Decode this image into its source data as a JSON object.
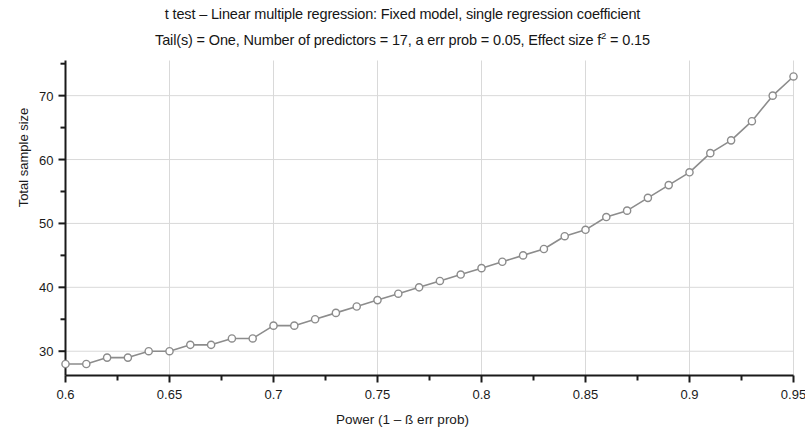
{
  "chart_data": {
    "type": "line",
    "title": "t test – Linear multiple regression: Fixed model, single regression coefficient",
    "subtitle_prefix": "Tail(s) = One, Number of predictors = 17, a  err prob = 0.05, Effect size f",
    "subtitle_sup": "2",
    "subtitle_suffix": " = 0.15",
    "xlabel": "Power (1 – ß err prob)",
    "ylabel": "Total sample size",
    "xlim": [
      0.6,
      0.95
    ],
    "ylim": [
      26.2,
      75.5
    ],
    "grid": true,
    "legend": "none",
    "marker": "open-circle",
    "line_color": "#8c8c8c",
    "marker_fill": "#ffffff",
    "marker_stroke": "#8c8c8c",
    "grid_color": "#d9d9d9",
    "axis_color": "#1a1a1a",
    "xticks": [
      0.6,
      0.65,
      0.7,
      0.75,
      0.8,
      0.85,
      0.9,
      0.95
    ],
    "xtick_labels": [
      "0.6",
      "0.65",
      "0.7",
      "0.75",
      "0.8",
      "0.85",
      "0.9",
      "0.95"
    ],
    "xminor_ticks": [
      0.625,
      0.675,
      0.725,
      0.775,
      0.825,
      0.875,
      0.925
    ],
    "yticks": [
      30,
      40,
      50,
      60,
      70
    ],
    "ytick_labels": [
      "30",
      "40",
      "50",
      "60",
      "70"
    ],
    "yminor_ticks": [
      35,
      45,
      55,
      65,
      75
    ],
    "x": [
      0.6,
      0.61,
      0.62,
      0.63,
      0.64,
      0.65,
      0.66,
      0.67,
      0.68,
      0.69,
      0.7,
      0.71,
      0.72,
      0.73,
      0.74,
      0.75,
      0.76,
      0.77,
      0.78,
      0.79,
      0.8,
      0.81,
      0.82,
      0.83,
      0.84,
      0.85,
      0.86,
      0.87,
      0.88,
      0.89,
      0.9,
      0.91,
      0.92,
      0.93,
      0.94,
      0.95
    ],
    "values": [
      28,
      28,
      29,
      29,
      30,
      30,
      31,
      31,
      32,
      32,
      34,
      34,
      35,
      36,
      37,
      38,
      39,
      40,
      41,
      42,
      43,
      44,
      45,
      46,
      48,
      49,
      51,
      52,
      54,
      56,
      58,
      61,
      63,
      66,
      70,
      73
    ],
    "series": [
      {
        "name": "Total sample size vs Power",
        "values": [
          28,
          28,
          29,
          29,
          30,
          30,
          31,
          31,
          32,
          32,
          34,
          34,
          35,
          36,
          37,
          38,
          39,
          40,
          41,
          42,
          43,
          44,
          45,
          46,
          48,
          49,
          51,
          52,
          54,
          56,
          58,
          61,
          63,
          66,
          70,
          73
        ]
      }
    ]
  }
}
